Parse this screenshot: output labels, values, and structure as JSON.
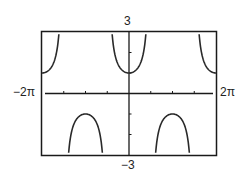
{
  "chart_data": {
    "type": "line",
    "title": "",
    "function": "y = sec(x)",
    "xlabel": "",
    "ylabel": "",
    "xlim": [
      -6.2832,
      6.2832
    ],
    "ylim": [
      -3,
      3
    ],
    "xlim_labels": {
      "min": "−2π",
      "max": "2π"
    },
    "ylim_labels": {
      "min": "−3",
      "max": "3"
    },
    "x_tick_step": 1.5708,
    "y_tick_step": 1,
    "grid": false,
    "asymptotes": [
      -4.7124,
      -1.5708,
      1.5708,
      4.7124
    ],
    "series": [
      {
        "name": "sec(x)",
        "branches": [
          {
            "x_range": [
              -6.2832,
              -4.7124
            ],
            "direction": "up"
          },
          {
            "x_range": [
              -4.7124,
              -1.5708
            ],
            "direction": "down"
          },
          {
            "x_range": [
              -1.5708,
              1.5708
            ],
            "direction": "up"
          },
          {
            "x_range": [
              1.5708,
              4.7124
            ],
            "direction": "down"
          },
          {
            "x_range": [
              4.7124,
              6.2832
            ],
            "direction": "up"
          }
        ],
        "sample_points": [
          {
            "x": -6.2832,
            "y": 1
          },
          {
            "x": -3.1416,
            "y": -1
          },
          {
            "x": 0,
            "y": 1
          },
          {
            "x": 3.1416,
            "y": -1
          },
          {
            "x": 6.2832,
            "y": 1
          }
        ]
      }
    ]
  },
  "labels": {
    "ymax": "3",
    "ymin": "−3",
    "xmin": "−2π",
    "xmax": "2π"
  },
  "colors": {
    "curve": "#2a2a2a",
    "frame": "#1a1a1a",
    "axis": "#1a1a1a",
    "background": "#ffffff"
  }
}
